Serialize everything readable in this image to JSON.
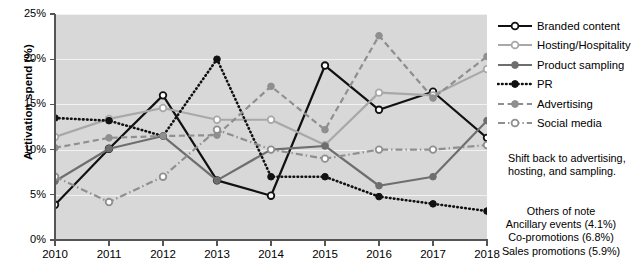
{
  "chart_data": {
    "type": "line",
    "title": "",
    "xlabel": "",
    "ylabel": "Activation spend (%)",
    "categories": [
      "2010",
      "2011",
      "2012",
      "2013",
      "2014",
      "2015",
      "2016",
      "2017",
      "2018"
    ],
    "x": [
      2010,
      2011,
      2012,
      2013,
      2014,
      2015,
      2016,
      2017,
      2018
    ],
    "ylim": [
      0,
      25
    ],
    "ytick_values": [
      0,
      5,
      10,
      15,
      20,
      25
    ],
    "ytick_labels": [
      "0%",
      "5%",
      "10%",
      "15%",
      "20%",
      "25%"
    ],
    "grid": "horizontal",
    "legend_position": "right",
    "series": [
      {
        "name": "Branded content",
        "values": [
          3.9,
          10.1,
          16.0,
          6.6,
          4.9,
          19.3,
          14.4,
          16.4,
          11.3
        ],
        "color": "#111111",
        "style": "solid",
        "marker": "open"
      },
      {
        "name": "Hosting/Hospitality",
        "values": [
          11.4,
          13.4,
          14.6,
          13.3,
          13.3,
          10.5,
          16.3,
          16.0,
          18.9
        ],
        "color": "#a8a8a8",
        "style": "solid",
        "marker": "open"
      },
      {
        "name": "Product sampling",
        "values": [
          6.5,
          10.1,
          11.5,
          6.6,
          10.0,
          10.4,
          6.0,
          7.0,
          13.2
        ],
        "color": "#6e6e6e",
        "style": "solid",
        "marker": "filled"
      },
      {
        "name": "PR",
        "values": [
          13.5,
          13.2,
          11.5,
          20.0,
          7.0,
          7.0,
          4.8,
          4.0,
          3.2
        ],
        "color": "#111111",
        "style": "dotted",
        "marker": "filled"
      },
      {
        "name": "Advertising",
        "values": [
          10.2,
          11.3,
          11.5,
          11.6,
          17.0,
          12.2,
          22.6,
          15.7,
          20.3
        ],
        "color": "#8f8f8f",
        "style": "dashed",
        "marker": "filled"
      },
      {
        "name": "Social media",
        "values": [
          7.0,
          4.2,
          7.0,
          12.2,
          10.0,
          9.0,
          10.0,
          10.0,
          10.5
        ],
        "color": "#8f8f8f",
        "style": "dashdot",
        "marker": "open"
      }
    ]
  },
  "annotations": {
    "note_shift": "Shift back to advertising, hosting, and sampling.",
    "others_title": "Others of note",
    "others_items": [
      "Ancillary events (4.1%)",
      "Co-promotions (6.8%)",
      "Sales promotions (5.9%)"
    ]
  },
  "colors": {
    "plot_background": "#d8d8d8",
    "gridline": "#f2f2f2",
    "axis": "#555555",
    "page_background": "#ffffff"
  }
}
